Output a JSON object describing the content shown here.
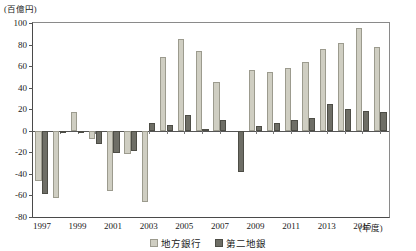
{
  "chart_data": {
    "type": "bar",
    "title": "",
    "subtitle": "",
    "unit_label": "(百億円)",
    "xlabel": "(年度)",
    "ylabel": "",
    "ylim": [
      -80,
      100
    ],
    "ytick_step": 20,
    "yticks": [
      100,
      80,
      60,
      40,
      20,
      0,
      -20,
      -40,
      -60,
      -80
    ],
    "ytick_labels": [
      "100",
      "80",
      "60",
      "40",
      "20",
      "0",
      "-20",
      "-40",
      "-60",
      "-80"
    ],
    "grid": false,
    "legend_position": "bottom-center",
    "categories": [
      "1997",
      "1998",
      "1999",
      "2000",
      "2001",
      "2002",
      "2003",
      "2004",
      "2005",
      "2006",
      "2007",
      "2008",
      "2009",
      "2010",
      "2011",
      "2012",
      "2013",
      "2014",
      "2015",
      "2016"
    ],
    "xtick_labels_shown": [
      "1997",
      "1999",
      "2001",
      "2003",
      "2005",
      "2007",
      "2009",
      "2011",
      "2013",
      "2015"
    ],
    "series": [
      {
        "name": "地方銀行",
        "color": "#cfcec2",
        "values": [
          -47,
          -62,
          17,
          -8,
          -56,
          -22,
          -66,
          68,
          85,
          74,
          45,
          0,
          56,
          55,
          58,
          64,
          76,
          81,
          95,
          78
        ]
      },
      {
        "name": "第二地銀",
        "color": "#6e6e66",
        "values": [
          -59,
          -1,
          -2,
          -12,
          -21,
          -19,
          7,
          5,
          15,
          2,
          10,
          -38,
          4,
          7,
          10,
          12,
          25,
          20,
          18,
          17
        ]
      }
    ]
  }
}
